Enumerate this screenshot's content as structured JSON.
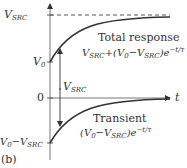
{
  "figure": {
    "panel_label": "(b)",
    "axis": {
      "t_label": "t",
      "zero_label": "0"
    },
    "levels": {
      "vsrc": {
        "sym": "V",
        "sub": "SRC"
      },
      "v0": {
        "sym": "V",
        "sub": "0"
      },
      "v0_minus_vsrc": {
        "a": "V",
        "a_sub": "0",
        "minus": "−",
        "b": "V",
        "b_sub": "SRC"
      }
    },
    "arrow_label": {
      "sym": "V",
      "sub": "SRC"
    },
    "total": {
      "title": "Total response",
      "f1": "V",
      "f1_sub": "SRC",
      "f2": "+(V",
      "f2_sub": "0",
      "f3": "−V",
      "f3_sub": "SRC",
      "f4": ")e",
      "exp": "−t/τ"
    },
    "transient": {
      "title": "Transient",
      "f1": "(V",
      "f1_sub": "0",
      "f2": "−V",
      "f2_sub": "SRC",
      "f3": ")e",
      "exp": "−t/τ"
    }
  }
}
